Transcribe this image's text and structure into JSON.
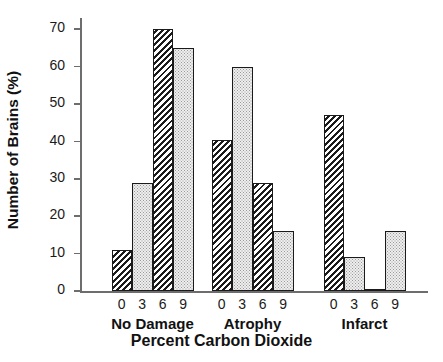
{
  "chart_data": {
    "type": "bar",
    "title": "",
    "xlabel": "Percent Carbon Dioxide",
    "ylabel": "Number of Brains (%)",
    "ylim": [
      0,
      73
    ],
    "yticks": [
      0,
      10,
      20,
      30,
      40,
      50,
      60,
      70
    ],
    "grid": false,
    "legend": "none",
    "group_labels": [
      "No Damage",
      "Atrophy",
      "Infarct"
    ],
    "categories": [
      "0",
      "3",
      "6",
      "9"
    ],
    "groups": [
      {
        "label": "No Damage",
        "bars": [
          {
            "category": "0",
            "value": 11,
            "pattern": "diagonal-hatch"
          },
          {
            "category": "3",
            "value": 29,
            "pattern": "dotted"
          },
          {
            "category": "6",
            "value": 70,
            "pattern": "diagonal-hatch"
          },
          {
            "category": "9",
            "value": 65,
            "pattern": "dotted"
          }
        ]
      },
      {
        "label": "Atrophy",
        "bars": [
          {
            "category": "0",
            "value": 40.5,
            "pattern": "diagonal-hatch"
          },
          {
            "category": "3",
            "value": 60,
            "pattern": "dotted"
          },
          {
            "category": "6",
            "value": 29,
            "pattern": "diagonal-hatch"
          },
          {
            "category": "9",
            "value": 16,
            "pattern": "dotted"
          }
        ]
      },
      {
        "label": "Infarct",
        "bars": [
          {
            "category": "0",
            "value": 47,
            "pattern": "diagonal-hatch"
          },
          {
            "category": "3",
            "value": 9,
            "pattern": "dotted"
          },
          {
            "category": "6",
            "value": 0.6,
            "pattern": "dotted"
          },
          {
            "category": "9",
            "value": 16,
            "pattern": "dotted"
          }
        ]
      }
    ],
    "colors": {
      "axis": "#6d6d6d",
      "bar_outline": "#1a1a1a",
      "hatch": "#1b1b1b",
      "dot_fill": "#eeeeee",
      "dot_color": "#9a9a9a",
      "text": "#111111",
      "background": "#ffffff"
    }
  }
}
